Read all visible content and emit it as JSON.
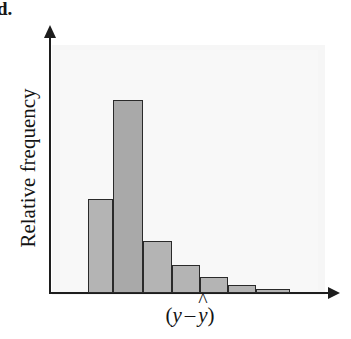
{
  "figure": {
    "part_label": "d.",
    "width": 351,
    "height": 339
  },
  "axes": {
    "y_title": "Relative frequency",
    "x_title": "(y – ŷ)",
    "x_title_parts": {
      "open_paren": "(",
      "first_var": "y",
      "minus": "–",
      "second_var": "y",
      "hat": "^",
      "close_paren": ")"
    },
    "x_arrow_icon": "arrow-right-icon",
    "y_arrow_icon": "arrow-up-icon"
  },
  "colors": {
    "bar_fill": "#b4b4b4",
    "bar_fill_tall": "#a9a9a9",
    "bar_stroke": "#2a2a2a",
    "axis": "#1d1d1d",
    "panel": "#f4f4f4",
    "text": "#141414"
  },
  "chart_data": {
    "type": "bar",
    "title": "",
    "subtitle": "",
    "xlabel": "(y – ŷ)",
    "ylabel": "Relative frequency",
    "grid": false,
    "legend": "none",
    "axis_ticks": [],
    "xlim": [
      0,
      1
    ],
    "ylim": [
      0,
      1
    ],
    "note": "Right-skewed relative-frequency histogram of residuals; heights are relative (unlabeled axis), read as fractions of the plot height.",
    "categories": [
      "bin1",
      "bin2",
      "bin3",
      "bin4",
      "bin5",
      "bin6",
      "bin7"
    ],
    "values": [
      0.365,
      0.749,
      0.202,
      0.109,
      0.062,
      0.031,
      0.016
    ],
    "bars": [
      {
        "name": "bin1",
        "x0": 88,
        "x1": 113,
        "height_px": 94,
        "value": 0.365
      },
      {
        "name": "bin2",
        "x0": 113,
        "x1": 143,
        "height_px": 193,
        "value": 0.749
      },
      {
        "name": "bin3",
        "x0": 143,
        "x1": 172,
        "height_px": 52,
        "value": 0.202
      },
      {
        "name": "bin4",
        "x0": 172,
        "x1": 200,
        "height_px": 28,
        "value": 0.109
      },
      {
        "name": "bin5",
        "x0": 200,
        "x1": 228,
        "height_px": 16,
        "value": 0.062
      },
      {
        "name": "bin6",
        "x0": 228,
        "x1": 256,
        "height_px": 8,
        "value": 0.031
      },
      {
        "name": "bin7",
        "x0": 256,
        "x1": 290,
        "height_px": 4,
        "value": 0.016
      }
    ],
    "baseline_y_px": 293
  }
}
